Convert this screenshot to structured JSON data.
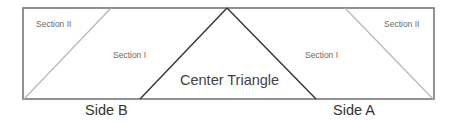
{
  "diagram": {
    "title": "",
    "colors": {
      "frame": "#777777",
      "center_lines": "#333333",
      "section_lines": "#b5b5b5",
      "label_text": "#555555"
    },
    "labels": {
      "section_ii_left": "Section II",
      "section_i_left": "Section I",
      "center_triangle": "Center Triangle",
      "section_i_right": "Section I",
      "section_ii_right": "Section II",
      "side_b": "Side B",
      "side_a": "Side A"
    },
    "geometry": {
      "rectangle": {
        "x1": 23,
        "y1": 8,
        "x2": 434,
        "y2": 99
      },
      "apex": {
        "x": 227,
        "y": 8
      },
      "center_triangle_base": {
        "left_x": 140,
        "right_x": 316,
        "y": 99
      },
      "left_section_divider": {
        "top_x": 111,
        "bottom_x": 24
      },
      "right_section_divider": {
        "top_x": 345,
        "bottom_x": 433
      }
    }
  }
}
